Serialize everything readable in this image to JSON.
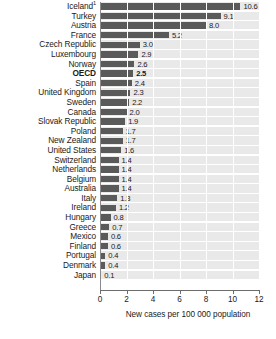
{
  "chart_data": {
    "type": "bar",
    "orientation": "horizontal",
    "title": "",
    "subtitle": "",
    "xlabel": "New cases per 100 000 population",
    "ylabel": "",
    "xlim": [
      0,
      12
    ],
    "xticks": [
      0,
      2,
      4,
      6,
      8,
      10,
      12
    ],
    "xtick_labels": [
      "0",
      "2",
      "4",
      "6",
      "8",
      "10",
      "12"
    ],
    "grid": true,
    "grid_axis": "x",
    "legend": false,
    "bar_color": "#5a5a5a",
    "band_color": "#e9e9e9",
    "categories": [
      "Iceland",
      "Turkey",
      "Austria",
      "France",
      "Czech Republic",
      "Luxembourg",
      "Norway",
      "OECD",
      "Spain",
      "United Kingdom",
      "Sweden",
      "Canada",
      "Slovak Republic",
      "Poland",
      "New Zealand",
      "United States",
      "Switzerland",
      "Netherlands",
      "Belgium",
      "Australia",
      "Italy",
      "Ireland",
      "Hungary",
      "Greece",
      "Mexico",
      "Finland",
      "Portugal",
      "Denmark",
      "Japan"
    ],
    "values": [
      10.6,
      9.1,
      8.0,
      5.2,
      3.0,
      2.9,
      2.6,
      2.5,
      2.4,
      2.3,
      2.2,
      2.0,
      1.9,
      1.7,
      1.7,
      1.6,
      1.4,
      1.4,
      1.4,
      1.4,
      1.3,
      1.2,
      0.8,
      0.7,
      0.6,
      0.6,
      0.4,
      0.4,
      0.1
    ],
    "value_labels": [
      "10.6",
      "9.1",
      "8.0",
      "5.2",
      "3.0",
      "2.9",
      "2.6",
      "2.5",
      "2.4",
      "2.3",
      "2.2",
      "2.0",
      "1.9",
      "1.7",
      "1.7",
      "1.6",
      "1.4",
      "1.4",
      "1.4",
      "1.4",
      "1.3",
      "1.2",
      "0.8",
      "0.7",
      "0.6",
      "0.6",
      "0.4",
      "0.4",
      "0.1"
    ],
    "category_footnotes": {
      "Iceland": "1"
    },
    "highlight_category": "OECD"
  }
}
